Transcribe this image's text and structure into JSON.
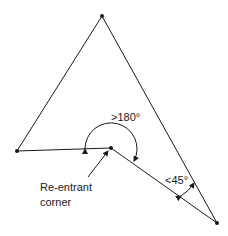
{
  "diagram": {
    "type": "polygon-angle-illustration",
    "vertices": {
      "top": [
        102,
        16
      ],
      "left": [
        17,
        151
      ],
      "reentrant": [
        111,
        148
      ],
      "bottom_right": [
        217,
        223
      ]
    },
    "labels": {
      "obtuse_angle": ">180°",
      "acute_angle": "<45°",
      "reentrant_line1": "Re-entrant",
      "reentrant_line2": "corner"
    },
    "colors": {
      "stroke": "#1a1a1a",
      "background": "#ffffff"
    }
  }
}
